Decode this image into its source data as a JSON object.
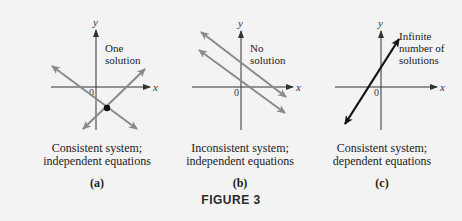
{
  "figure": {
    "title": "FIGURE 3",
    "colors": {
      "background": "#f3f3f3",
      "gray_line": "#8a8a8a",
      "black_line": "#111111",
      "axis": "#333333"
    },
    "axis_labels": {
      "x": "x",
      "y": "y",
      "origin": "0"
    },
    "panels": [
      {
        "id": "a",
        "sublabel": "(a)",
        "annotation": [
          "One",
          "solution"
        ],
        "caption": [
          "Consistent system;",
          "independent equations"
        ],
        "lines": [
          {
            "description": "line with negative slope",
            "color": "gray"
          },
          {
            "description": "line with positive slope",
            "color": "gray"
          }
        ],
        "intersection_point": "single point below x-axis, right of y-axis"
      },
      {
        "id": "b",
        "sublabel": "(b)",
        "annotation": [
          "No",
          "solution"
        ],
        "caption": [
          "Inconsistent system;",
          "independent equations"
        ],
        "lines": [
          {
            "description": "upper parallel line, negative slope",
            "color": "gray"
          },
          {
            "description": "lower parallel line, negative slope",
            "color": "gray"
          }
        ]
      },
      {
        "id": "c",
        "sublabel": "(c)",
        "annotation": [
          "Infinite",
          "number of",
          "solutions"
        ],
        "caption": [
          "Consistent system;",
          "dependent equations"
        ],
        "lines": [
          {
            "description": "coincident lines, positive slope",
            "color": "black"
          }
        ]
      }
    ]
  }
}
